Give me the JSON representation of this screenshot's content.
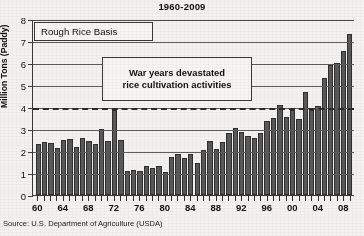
{
  "chart_data": {
    "type": "bar",
    "title": "1960-2009",
    "xlabel": "",
    "ylabel": "Million Tons (Paddy)",
    "ylim": [
      0,
      8
    ],
    "yticks": [
      0,
      1,
      2,
      3,
      4,
      5,
      6,
      7,
      8
    ],
    "grid": true,
    "legend_label": "Rough Rice Basis",
    "reference_line": {
      "value": 4,
      "style": "dashed"
    },
    "annotations": [
      {
        "line1": "War years devastated",
        "line2": "rice cultivation activities"
      }
    ],
    "source": "Source: U.S. Department of Agriculture (USDA)",
    "x_tick_labels": [
      "60",
      "64",
      "68",
      "72",
      "76",
      "80",
      "84",
      "88",
      "92",
      "96",
      "00",
      "04",
      "08"
    ],
    "x_tick_step": 4,
    "categories": [
      "60",
      "61",
      "62",
      "63",
      "64",
      "65",
      "66",
      "67",
      "68",
      "69",
      "70",
      "71",
      "72",
      "73",
      "74",
      "75",
      "76",
      "77",
      "78",
      "79",
      "80",
      "81",
      "82",
      "83",
      "84",
      "85",
      "86",
      "87",
      "88",
      "89",
      "90",
      "91",
      "92",
      "93",
      "94",
      "95",
      "96",
      "97",
      "98",
      "99",
      "00",
      "01",
      "02",
      "03",
      "04",
      "05",
      "06",
      "07",
      "08",
      "09"
    ],
    "values": [
      2.3,
      2.4,
      2.35,
      2.15,
      2.5,
      2.55,
      2.2,
      2.6,
      2.45,
      2.3,
      3.0,
      2.45,
      3.85,
      2.5,
      1.1,
      1.15,
      1.1,
      1.3,
      1.25,
      1.3,
      1.05,
      1.75,
      1.85,
      1.7,
      1.85,
      1.45,
      2.05,
      2.45,
      2.1,
      2.4,
      2.8,
      3.05,
      2.85,
      2.7,
      2.6,
      2.8,
      3.35,
      3.5,
      4.1,
      3.55,
      3.85,
      3.45,
      4.7,
      3.85,
      4.05,
      5.3,
      5.9,
      6.0,
      6.55,
      7.3
    ]
  }
}
